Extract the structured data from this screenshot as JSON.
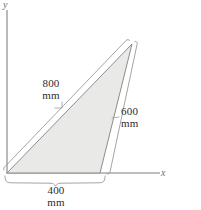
{
  "figure": {
    "kind": "engineering-dimension-diagram",
    "shape": "right-triangle",
    "background_color": "#ffffff",
    "fill_color": "#e9e9e7",
    "line_color": "#8d8d8d",
    "text_color": "#2b2b2b",
    "axes": {
      "x_label": "x",
      "y_label": "y",
      "origin": {
        "x": 7,
        "y": 173
      }
    },
    "dimensions": [
      {
        "name": "hypotenuse",
        "value": "800",
        "unit": "mm",
        "edge": "origin-to-apex"
      },
      {
        "name": "right-side",
        "value": "600",
        "unit": "mm",
        "edge": "base-right-to-apex"
      },
      {
        "name": "base",
        "value": "400",
        "unit": "mm",
        "edge": "origin-to-base-right"
      }
    ],
    "vertices": {
      "origin": {
        "x": 7,
        "y": 173
      },
      "base_right": {
        "x": 100,
        "y": 173
      },
      "apex": {
        "x": 132,
        "y": 44
      }
    }
  }
}
